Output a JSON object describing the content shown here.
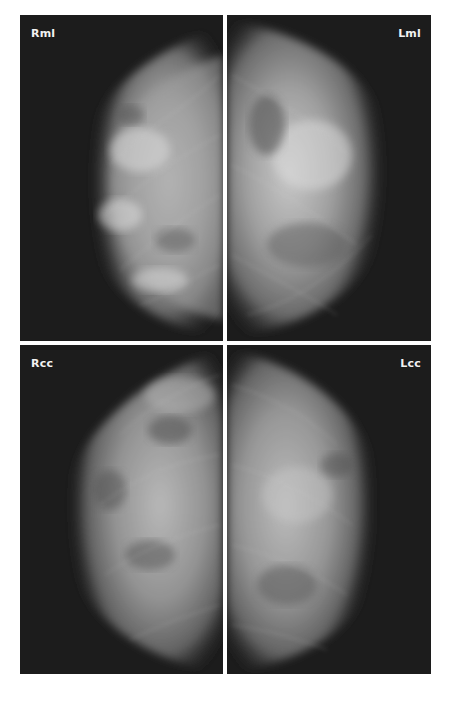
{
  "figure": {
    "panels": [
      {
        "id": "rml",
        "label": "Rml",
        "side": "right",
        "view": "mediolateral"
      },
      {
        "id": "lml",
        "label": "Lml",
        "side": "left",
        "view": "mediolateral"
      },
      {
        "id": "rcc",
        "label": "Rcc",
        "side": "right",
        "view": "craniocaudal"
      },
      {
        "id": "lcc",
        "label": "Lcc",
        "side": "left",
        "view": "craniocaudal"
      }
    ],
    "colors": {
      "background": "#ffffff",
      "panel_background": "#1c1c1c",
      "tissue_dense": "#d8d8d8",
      "tissue_mid": "#8a8a8a",
      "label": "#f2f2f2"
    }
  }
}
